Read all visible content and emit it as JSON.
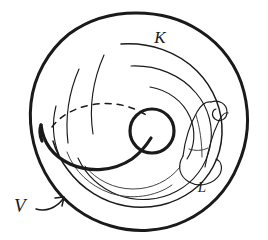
{
  "figure": {
    "kind": "hand-drawn-diagram",
    "background_color": "#ffffff",
    "ink_color": "#1a1a1a",
    "canvas": {
      "width": 268,
      "height": 240
    }
  },
  "labels": {
    "knot": {
      "text": "K",
      "x": 160,
      "y": 43,
      "font_size": 17,
      "font_style": "italic"
    },
    "band": {
      "text": "L",
      "x": 202,
      "y": 192,
      "font_size": 15,
      "font_style": "italic"
    },
    "torus": {
      "text": "V",
      "x": 14,
      "y": 212,
      "font_size": 19,
      "font_style": "italic"
    }
  },
  "annotations": {
    "arrow": {
      "name": "pointer-arrow",
      "from_x": 36,
      "from_y": 207,
      "to_x": 62,
      "to_y": 198,
      "points_to": "torus-outer-boundary"
    }
  },
  "strokes": {
    "outer_boundary": {
      "name": "torus-outer-boundary",
      "d": "M 136 13 C 182 13 224 40 241 78 C 256 112 254 152 236 183 C 218 213 185 230 150 230 C 112 230 76 214 55 186 C 34 158 26 120 34 86 C 43 50 74 22 110 15 C 119 13 128 13 136 13 Z",
      "width": 3.0
    },
    "inner_tube_outer": {
      "name": "tube-contour-outer",
      "d": "M 128 44 C 162 44 196 63 211 93 C 224 118 223 148 208 169 C 192 191 163 202 135 201 C 104 200 74 186 59 161",
      "width": 1.5
    },
    "inner_tube_mid": {
      "name": "tube-contour-middle",
      "d": "M 139 63 C 168 65 194 83 203 107 C 211 128 206 150 190 164 C 172 180 146 185 122 180 C 101 176 83 164 73 148",
      "width": 1.15
    },
    "inner_tube_lower": {
      "name": "tube-contour-lower",
      "d": "M 80 170 C 96 186 121 195 145 192 C 166 190 184 180 194 165",
      "width": 1.15
    },
    "hole_circle": {
      "name": "torus-hole-circle",
      "cx": 152,
      "cy": 131,
      "r": 22,
      "width": 3.2
    },
    "hidden_arc": {
      "name": "hidden-back-arc-dashed",
      "d": "M 55 134 C 64 116 84 103 108 99 C 124 96 140 98 152 104",
      "width": 1.5,
      "dash": "6 6"
    },
    "knot_front": {
      "name": "knot-front-strand",
      "d": "M 42 127 C 47 146 63 159 86 162 C 110 165 132 155 146 140 C 152 133 156 127 159 121",
      "width": 3.2
    },
    "band_left_edge": {
      "name": "band-left-edge",
      "d": "M 185 155 C 187 139 192 124 199 111 C 203 104 208 100 213 101",
      "width": 1.2
    },
    "band_right_edge": {
      "name": "band-right-edge",
      "d": "M 206 166 C 209 150 213 134 219 121 C 222 114 226 110 229 110",
      "width": 1.2
    },
    "band_hook": {
      "name": "band-hook-curl",
      "d": "M 213 101 C 221 99 227 104 227 111 C 227 118 221 121 216 118 C 212 115 212 110 215 108",
      "width": 1.2
    },
    "band_bottom_loop": {
      "name": "band-bottom-loop",
      "d": "M 185 155 C 180 165 182 175 192 180 C 203 186 216 182 221 172 C 224 166 222 160 217 158",
      "width": 1.2
    },
    "band_cross": {
      "name": "band-cross-tick",
      "d": "M 190 148 C 196 150 203 150 209 148",
      "width": 1.1
    }
  }
}
